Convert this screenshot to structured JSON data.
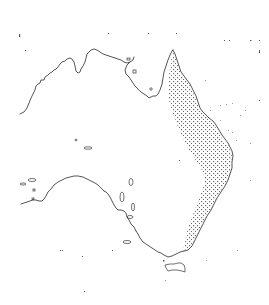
{
  "map": {
    "subject": "Australia coastline outline",
    "background_color": "#ffffff",
    "coast_color": "#2a2a2a",
    "range_fill": "stippled-dots",
    "range_dot_color": "#6a6a6a",
    "highlighted_region": "eastern coastal strip (Cape York to Victoria)",
    "labels": []
  }
}
